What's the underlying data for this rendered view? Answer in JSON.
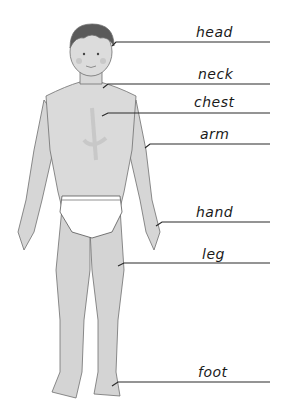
{
  "diagram": {
    "labels": [
      {
        "text": "head",
        "line_y": 42,
        "line_x1": 116,
        "pointer_y": 44
      },
      {
        "text": "neck",
        "line_y": 84,
        "line_x1": 106,
        "pointer_y": 86
      },
      {
        "text": "chest",
        "line_y": 113,
        "line_x1": 105,
        "pointer_y": 116
      },
      {
        "text": "arm",
        "line_y": 144,
        "line_x1": 147,
        "pointer_y": 148
      },
      {
        "text": "hand",
        "line_y": 222,
        "line_x1": 158,
        "pointer_y": 226
      },
      {
        "text": "leg",
        "line_y": 263,
        "line_x1": 121,
        "pointer_y": 266
      },
      {
        "text": "foot",
        "line_y": 382,
        "line_x1": 114,
        "pointer_y": 386
      }
    ],
    "colors": {
      "line": "#2a2a2a",
      "skin": "#d9d9d9",
      "skin_shadow": "#bdbdbd",
      "hair": "#5a5a5a",
      "underwear": "#ffffff"
    }
  }
}
